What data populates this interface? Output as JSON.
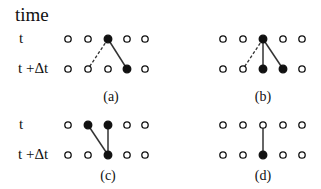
{
  "title": "time",
  "row_labels": {
    "top_t": "t",
    "top_tdt": "t +Δt",
    "bottom_t": "t",
    "bottom_tdt": "t +Δt"
  },
  "colors": {
    "ink": "#111111",
    "background": "#ffffff",
    "solid_line": "#333333",
    "dashed_line": "#333333"
  },
  "panels": [
    {
      "id": "a",
      "caption": "(a)",
      "columns_x": [
        68,
        88,
        108,
        127,
        145
      ],
      "rows_y": [
        39,
        69
      ],
      "filled_top": [
        2
      ],
      "filled_bottom": [
        3
      ],
      "solid_links": [
        [
          2,
          3
        ]
      ],
      "dashed_links": [
        [
          2,
          1
        ]
      ],
      "caption_pos": [
        111,
        90
      ]
    },
    {
      "id": "b",
      "caption": "(b)",
      "columns_x": [
        223,
        243,
        263,
        283,
        302
      ],
      "rows_y": [
        39,
        69
      ],
      "filled_top": [
        2
      ],
      "filled_bottom": [
        2,
        3
      ],
      "solid_links": [
        [
          2,
          2
        ],
        [
          2,
          3
        ]
      ],
      "dashed_links": [
        [
          2,
          1
        ]
      ],
      "caption_pos": [
        263,
        90
      ]
    },
    {
      "id": "c",
      "caption": "(c)",
      "columns_x": [
        68,
        88,
        108,
        127,
        145
      ],
      "rows_y": [
        125,
        155
      ],
      "filled_top": [
        1,
        2
      ],
      "filled_bottom": [
        2
      ],
      "solid_links": [
        [
          1,
          2
        ],
        [
          2,
          2
        ]
      ],
      "dashed_links": [],
      "caption_pos": [
        108,
        169
      ]
    },
    {
      "id": "d",
      "caption": "(d)",
      "columns_x": [
        223,
        243,
        263,
        283,
        302
      ],
      "rows_y": [
        125,
        155
      ],
      "filled_top": [],
      "filled_bottom": [
        2
      ],
      "solid_links": [
        [
          2,
          2
        ]
      ],
      "dashed_links": [],
      "caption_pos": [
        263,
        169
      ]
    }
  ]
}
